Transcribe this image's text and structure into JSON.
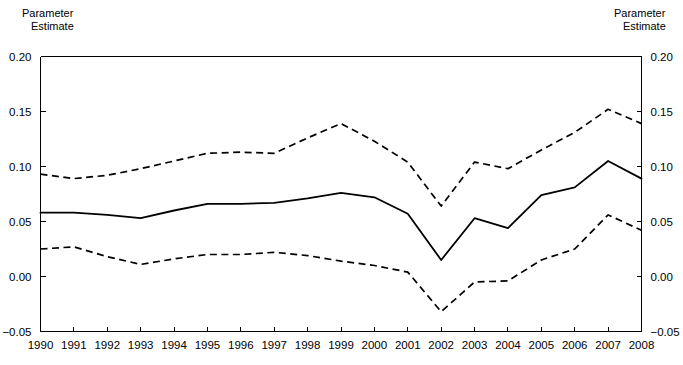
{
  "chart_data": {
    "type": "line",
    "title": "",
    "xlabel": "",
    "ylabel": "Parameter Estimate",
    "ylabel_right": "Parameter Estimate",
    "ylim": [
      -0.05,
      0.2
    ],
    "xlim": [
      1990,
      2008
    ],
    "grid": false,
    "legend_position": "none",
    "y_ticks": [
      "0.20",
      "0.15",
      "0.10",
      "0.05",
      "0.00",
      "-0.05"
    ],
    "y_tick_values": [
      0.2,
      0.15,
      0.1,
      0.05,
      0.0,
      -0.05
    ],
    "categories": [
      "1990",
      "1991",
      "1992",
      "1993",
      "1994",
      "1995",
      "1996",
      "1997",
      "1998",
      "1999",
      "2000",
      "2001",
      "2002",
      "2003",
      "2004",
      "2005",
      "2006",
      "2007",
      "2008"
    ],
    "x": [
      1990,
      1991,
      1992,
      1993,
      1994,
      1995,
      1996,
      1997,
      1998,
      1999,
      2000,
      2001,
      2002,
      2003,
      2004,
      2005,
      2006,
      2007,
      2008
    ],
    "series": [
      {
        "name": "Upper confidence bound",
        "style": "dashed",
        "color": "#000000",
        "values": [
          0.093,
          0.089,
          0.092,
          0.098,
          0.105,
          0.112,
          0.113,
          0.112,
          0.126,
          0.139,
          0.123,
          0.104,
          0.064,
          0.104,
          0.098,
          0.115,
          0.131,
          0.152,
          0.139
        ]
      },
      {
        "name": "Parameter estimate",
        "style": "solid",
        "color": "#000000",
        "values": [
          0.058,
          0.058,
          0.056,
          0.053,
          0.06,
          0.066,
          0.066,
          0.067,
          0.071,
          0.076,
          0.072,
          0.057,
          0.015,
          0.053,
          0.044,
          0.074,
          0.081,
          0.105,
          0.089
        ]
      },
      {
        "name": "Lower confidence bound",
        "style": "dashed",
        "color": "#000000",
        "values": [
          0.025,
          0.027,
          0.018,
          0.011,
          0.016,
          0.02,
          0.02,
          0.022,
          0.019,
          0.014,
          0.01,
          0.004,
          -0.032,
          -0.005,
          -0.004,
          0.015,
          0.025,
          0.056,
          0.042
        ]
      }
    ]
  },
  "left_axis": {
    "title_line1": "Parameter",
    "title_line2": "Estimate"
  },
  "right_axis": {
    "title_line1": "Parameter",
    "title_line2": "Estimate"
  }
}
